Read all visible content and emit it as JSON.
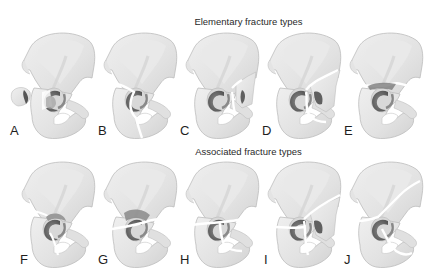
{
  "figure": {
    "rows": [
      {
        "title": "Elementary fracture types",
        "panels": [
          {
            "label": "A",
            "fracture": "posterior-wall"
          },
          {
            "label": "B",
            "fracture": "posterior-column"
          },
          {
            "label": "C",
            "fracture": "anterior-wall"
          },
          {
            "label": "D",
            "fracture": "anterior-column"
          },
          {
            "label": "E",
            "fracture": "transverse"
          }
        ]
      },
      {
        "title": "Associated fracture types",
        "panels": [
          {
            "label": "F",
            "fracture": "posterior-column-and-posterior-wall"
          },
          {
            "label": "G",
            "fracture": "transverse-and-posterior-wall"
          },
          {
            "label": "H",
            "fracture": "t-shaped"
          },
          {
            "label": "I",
            "fracture": "anterior-column-and-posterior-hemitransverse"
          },
          {
            "label": "J",
            "fracture": "both-column"
          }
        ]
      }
    ],
    "colors": {
      "bone_fill": "#e6e6e6",
      "bone_shade": "#cfcfcf",
      "bone_outline": "#b8b8b8",
      "acetabulum": "#6e6e6e",
      "fracture_line": "#ffffff",
      "text": "#222222"
    }
  }
}
